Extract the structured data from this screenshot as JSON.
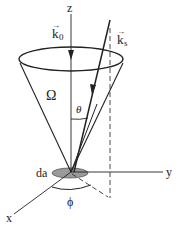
{
  "diagram": {
    "labels": {
      "z_axis": "z",
      "y_axis": "y",
      "x_axis": "x",
      "incident_wavevector": "k",
      "incident_subscript": "0",
      "scattered_wavevector": "k",
      "scattered_subscript": "s",
      "solid_angle": "Ω",
      "polar_angle": "θ",
      "azimuthal_angle": "ϕ",
      "area_element": "da"
    },
    "colors": {
      "line": "#222222",
      "area_fill": "#9a9a9a",
      "background": "#ffffff"
    }
  }
}
